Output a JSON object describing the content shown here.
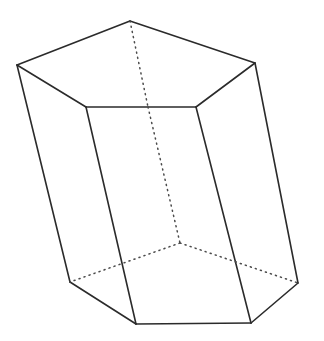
{
  "figure": {
    "name": "pentagonal-prism",
    "kind": "3d-solid-line-drawing",
    "background_color": "#ffffff",
    "visible_edge_color": "#2b2b2b",
    "hidden_edge_color": "#4a4a4a",
    "visible_edge_width": 1.6,
    "hidden_edge_width": 1.5,
    "hidden_dash_pattern": "1.1 4.2",
    "width": 324,
    "height": 341,
    "vertices": {
      "top_left": [
        17,
        65
      ],
      "top_apex": [
        130,
        21
      ],
      "top_right": [
        255,
        63
      ],
      "top_front_right": [
        196,
        107
      ],
      "top_front_left": [
        86,
        107
      ],
      "top_back_hidden": [
        148,
        107
      ],
      "bottom_left": [
        70,
        282
      ],
      "bottom_front_left": [
        136,
        324
      ],
      "bottom_front_right": [
        251,
        323
      ],
      "bottom_right": [
        298,
        283
      ],
      "bottom_back_hidden": [
        180,
        243
      ]
    },
    "visible_edges": [
      {
        "name": "top-edge-left-apex",
        "from": "top_left",
        "to": "top_apex"
      },
      {
        "name": "top-edge-apex-right",
        "from": "top_apex",
        "to": "top_right"
      },
      {
        "name": "top-edge-right-frontright",
        "from": "top_right",
        "to": "top_front_right"
      },
      {
        "name": "top-edge-frontright-frontleft",
        "from": "top_front_right",
        "to": "top_front_left"
      },
      {
        "name": "top-edge-frontleft-left",
        "from": "top_front_left",
        "to": "top_left"
      },
      {
        "name": "lateral-edge-left",
        "from": "top_left",
        "to": "bottom_left"
      },
      {
        "name": "lateral-edge-front-left",
        "from": "top_front_left",
        "to": "bottom_front_left"
      },
      {
        "name": "lateral-edge-front-right",
        "from": "top_front_right",
        "to": "bottom_front_right"
      },
      {
        "name": "lateral-edge-right",
        "from": "top_right",
        "to": "bottom_right"
      },
      {
        "name": "bottom-edge-left-frontleft",
        "from": "bottom_left",
        "to": "bottom_front_left"
      },
      {
        "name": "bottom-edge-frontleft-frontright",
        "from": "bottom_front_left",
        "to": "bottom_front_right"
      },
      {
        "name": "bottom-edge-frontright-right",
        "from": "bottom_front_right",
        "to": "bottom_right"
      }
    ],
    "hidden_edges": [
      {
        "name": "hidden-top-edge-apex-back",
        "from": "top_apex",
        "to": "top_back_hidden"
      },
      {
        "name": "hidden-lateral-edge-back",
        "from": "top_back_hidden",
        "to": "bottom_back_hidden"
      },
      {
        "name": "hidden-bottom-edge-back-left",
        "from": "bottom_back_hidden",
        "to": "bottom_left"
      },
      {
        "name": "hidden-bottom-edge-back-right",
        "from": "bottom_back_hidden",
        "to": "bottom_right"
      }
    ]
  }
}
